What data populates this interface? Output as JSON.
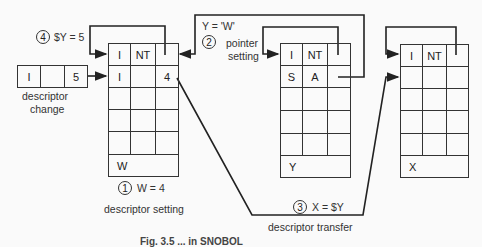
{
  "diagram": {
    "change_box": {
      "cells": [
        "I",
        "",
        "5"
      ],
      "label_line1": "descriptor",
      "label_line2": "change"
    },
    "w_box": {
      "rows": [
        [
          "I",
          "NT",
          ""
        ],
        [
          "I",
          "",
          "4"
        ],
        [
          "",
          "",
          ""
        ],
        [
          "",
          "",
          ""
        ],
        [
          "",
          "",
          ""
        ]
      ],
      "name": "W"
    },
    "y_box": {
      "rows": [
        [
          "I",
          "NT",
          ""
        ],
        [
          "S",
          "A",
          ""
        ],
        [
          "",
          "",
          ""
        ],
        [
          "",
          "",
          ""
        ],
        [
          "",
          "",
          ""
        ]
      ],
      "name": "Y"
    },
    "x_box": {
      "rows": [
        [
          "I",
          "NT",
          ""
        ],
        [
          "",
          "",
          ""
        ],
        [
          "",
          "",
          ""
        ],
        [
          "",
          "",
          ""
        ],
        [
          "",
          "",
          ""
        ]
      ],
      "name": "X"
    },
    "steps": [
      {
        "num": "1",
        "expr": "W = 4",
        "desc": "descriptor setting"
      },
      {
        "num": "2",
        "expr": "Y = 'W'",
        "desc_line1": "pointer",
        "desc_line2": "setting"
      },
      {
        "num": "3",
        "expr": "X = $Y",
        "desc": "descriptor transfer"
      },
      {
        "num": "4",
        "expr": "$Y = 5"
      }
    ],
    "caption": "Fig. 3.5 ... in SNOBOL"
  }
}
